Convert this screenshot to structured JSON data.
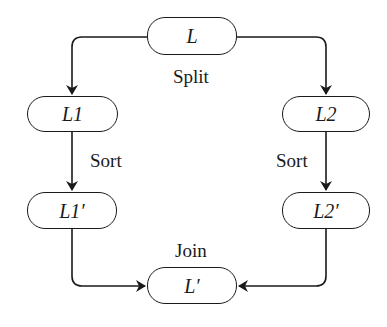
{
  "diagram": {
    "type": "flowchart",
    "nodes": {
      "L": {
        "label": "L",
        "x": 147,
        "y": 17,
        "w": 90,
        "h": 38
      },
      "L1": {
        "label": "L1",
        "x": 27,
        "y": 96,
        "w": 91,
        "h": 36
      },
      "L2": {
        "label": "L2",
        "x": 282,
        "y": 96,
        "w": 88,
        "h": 36
      },
      "L1prime": {
        "label": "L1′",
        "x": 27,
        "y": 192,
        "w": 90,
        "h": 37
      },
      "L2prime": {
        "label": "L2′",
        "x": 282,
        "y": 192,
        "w": 88,
        "h": 37
      },
      "Lprime": {
        "label": "L′",
        "x": 147,
        "y": 267,
        "w": 90,
        "h": 37
      }
    },
    "edge_labels": {
      "split": "Split",
      "sort_left": "Sort",
      "sort_right": "Sort",
      "join": "Join"
    },
    "edges": [
      {
        "from": "L",
        "to": "L1",
        "label": "Split"
      },
      {
        "from": "L",
        "to": "L2",
        "label": "Split"
      },
      {
        "from": "L1",
        "to": "L1prime",
        "label": "Sort"
      },
      {
        "from": "L2",
        "to": "L2prime",
        "label": "Sort"
      },
      {
        "from": "L1prime",
        "to": "Lprime",
        "label": "Join"
      },
      {
        "from": "L2prime",
        "to": "Lprime",
        "label": "Join"
      }
    ],
    "colors": {
      "stroke": "#1a1a1a",
      "background": "#ffffff"
    }
  }
}
